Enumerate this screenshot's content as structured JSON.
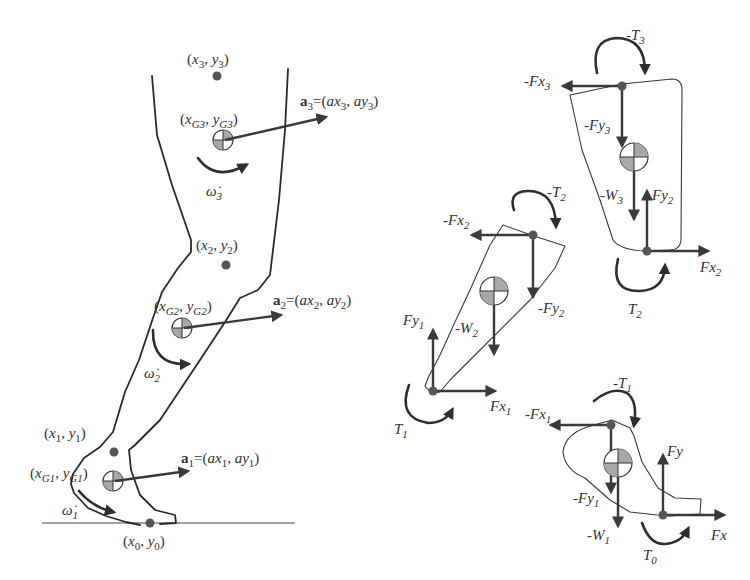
{
  "colors": {
    "ink": "#333333",
    "joint": "#555555",
    "hatch": "#9a9a9a",
    "background": "#ffffff"
  },
  "leg_model": {
    "joints": [
      {
        "id": "hip",
        "label_x": "x",
        "label_y": "y",
        "sub": "3"
      },
      {
        "id": "knee",
        "label_x": "x",
        "label_y": "y",
        "sub": "2"
      },
      {
        "id": "ankle",
        "label_x": "x",
        "label_y": "y",
        "sub": "1"
      },
      {
        "id": "ground_contact",
        "label_x": "x",
        "label_y": "y",
        "sub": "0"
      }
    ],
    "centers_of_mass": [
      {
        "segment": "thigh",
        "label_x": "x",
        "label_y": "y",
        "sub": "G3"
      },
      {
        "segment": "shank",
        "label_x": "x",
        "label_y": "y",
        "sub": "G2"
      },
      {
        "segment": "foot",
        "label_x": "x",
        "label_y": "y",
        "sub": "G1"
      }
    ],
    "accelerations": [
      {
        "vector": "a",
        "sub": "3",
        "ax": "ax",
        "ay": "ay"
      },
      {
        "vector": "a",
        "sub": "2",
        "ax": "ax",
        "ay": "ay"
      },
      {
        "vector": "a",
        "sub": "1",
        "ax": "ax",
        "ay": "ay"
      }
    ],
    "angular_accelerations": [
      {
        "symbol": "ω̇",
        "sub": "3"
      },
      {
        "symbol": "ω̇",
        "sub": "2"
      },
      {
        "symbol": "ω̇",
        "sub": "1"
      }
    ]
  },
  "free_body_diagrams": {
    "thigh": {
      "torque_top": {
        "prefix": "-",
        "sym": "T",
        "sub": "3"
      },
      "force_x_top": {
        "prefix": "-",
        "sym": "Fx",
        "sub": "3"
      },
      "force_y_top": {
        "prefix": "-",
        "sym": "Fy",
        "sub": "3"
      },
      "weight": {
        "prefix": "-",
        "sym": "W",
        "sub": "3"
      },
      "force_y_bottom": {
        "prefix": "",
        "sym": "Fy",
        "sub": "2"
      },
      "force_x_bottom": {
        "prefix": "",
        "sym": "Fx",
        "sub": "2"
      },
      "torque_bottom": {
        "prefix": "",
        "sym": "T",
        "sub": "2"
      }
    },
    "shank": {
      "torque_top": {
        "prefix": "-",
        "sym": "T",
        "sub": "2"
      },
      "force_x_top": {
        "prefix": "-",
        "sym": "Fx",
        "sub": "2"
      },
      "force_y_top": {
        "prefix": "-",
        "sym": "Fy",
        "sub": "2"
      },
      "weight": {
        "prefix": "-",
        "sym": "W",
        "sub": "2"
      },
      "force_y_bottom": {
        "prefix": "",
        "sym": "Fy",
        "sub": "1"
      },
      "force_x_bottom": {
        "prefix": "",
        "sym": "Fx",
        "sub": "1"
      },
      "torque_bottom": {
        "prefix": "",
        "sym": "T",
        "sub": "1"
      }
    },
    "foot": {
      "torque_top": {
        "prefix": "-",
        "sym": "T",
        "sub": "1"
      },
      "force_x_top": {
        "prefix": "-",
        "sym": "Fx",
        "sub": "1"
      },
      "force_y_top": {
        "prefix": "-",
        "sym": "Fy",
        "sub": "1"
      },
      "weight": {
        "prefix": "-",
        "sym": "W",
        "sub": "1"
      },
      "force_y_ground": {
        "prefix": "",
        "sym": "Fy",
        "sub": ""
      },
      "force_x_ground": {
        "prefix": "",
        "sym": "Fx",
        "sub": ""
      },
      "torque_ground": {
        "prefix": "",
        "sym": "T",
        "sub": "0"
      }
    }
  },
  "text": {
    "open": "(",
    "comma": ", ",
    "close": ")",
    "eq": "=("
  }
}
